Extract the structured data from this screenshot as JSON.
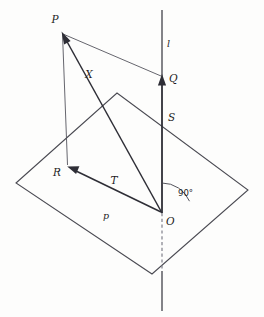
{
  "figure": {
    "background_color": "#fdfdfc",
    "ink_color": "#2e2e36",
    "width": 264,
    "height": 317
  },
  "labels": {
    "point_p": "P",
    "point_q": "Q",
    "point_r": "R",
    "point_s": "S",
    "point_o": "O",
    "vector_x": "X",
    "vector_t": "T",
    "line_l": "l",
    "plane_p": "p",
    "right_angle": "90°"
  },
  "points": {
    "P": {
      "x": 62,
      "y": 33,
      "label": "P"
    },
    "Q": {
      "x": 162,
      "y": 77,
      "label": "Q"
    },
    "S": {
      "x": 162,
      "y": 123,
      "label": "S"
    },
    "O": {
      "x": 162,
      "y": 213,
      "label": "O"
    },
    "R": {
      "x": 68,
      "y": 167,
      "label": "R"
    }
  },
  "plane": {
    "name": "p",
    "vertices": [
      {
        "x": 16,
        "y": 183
      },
      {
        "x": 117,
        "y": 93
      },
      {
        "x": 248,
        "y": 190
      },
      {
        "x": 152,
        "y": 274
      }
    ]
  },
  "line_l": {
    "name": "l",
    "x": 162,
    "solid_top_y": 10,
    "solid_bottom_y": 213,
    "dashed_from_y": 213,
    "dashed_to_y": 270,
    "tail_to_y": 311
  },
  "vectors": [
    {
      "name": "X",
      "from": "O",
      "to": "P",
      "label": "X",
      "arrow_at": "P"
    },
    {
      "name": "OQ",
      "from": "O",
      "to": "Q",
      "label": "",
      "arrow_at": "Q"
    },
    {
      "name": "T",
      "from": "O",
      "to": "R",
      "label": "T",
      "arrow_at": "R"
    }
  ],
  "connectors": [
    {
      "name": "PQ",
      "from": "P",
      "to": "Q"
    },
    {
      "name": "PR",
      "from": "P",
      "to": "R"
    }
  ],
  "angle_marker": {
    "at": "O",
    "value": "90°",
    "between": [
      "line_l",
      "plane_p"
    ]
  },
  "label_positions": {
    "P": {
      "x": 55,
      "y": 23
    },
    "Q": {
      "x": 169,
      "y": 80
    },
    "S": {
      "x": 168,
      "y": 121
    },
    "O": {
      "x": 168,
      "y": 224
    },
    "R": {
      "x": 57,
      "y": 176
    },
    "X": {
      "x": 89,
      "y": 77
    },
    "T": {
      "x": 113,
      "y": 184
    },
    "l": {
      "x": 166,
      "y": 45
    },
    "p": {
      "x": 105,
      "y": 218
    },
    "ang": {
      "x": 178,
      "y": 195
    }
  }
}
